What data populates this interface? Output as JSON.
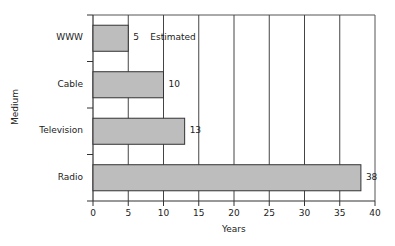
{
  "chart_data": {
    "type": "bar",
    "orientation": "horizontal",
    "title": "",
    "xlabel": "Years",
    "ylabel": "Medium",
    "categories": [
      "WWW",
      "Cable",
      "Television",
      "Radio"
    ],
    "values": [
      5,
      10,
      13,
      38
    ],
    "value_labels": [
      "5",
      "10",
      "13",
      "38"
    ],
    "annotations": [
      {
        "category": "WWW",
        "text": "Estimated"
      }
    ],
    "xlim": [
      0,
      40
    ],
    "xticks": [
      0,
      5,
      10,
      15,
      20,
      25,
      30,
      35,
      40
    ],
    "grid": {
      "vertical": true,
      "horizontal": false
    },
    "legend": null,
    "bar_color": "#bdbdbd",
    "bar_edge": "#333333"
  }
}
